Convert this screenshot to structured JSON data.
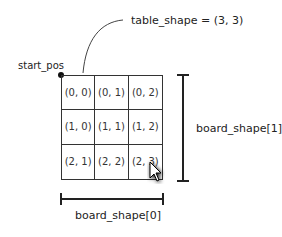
{
  "annotation": {
    "table_shape": "table_shape = (3, 3)",
    "start_pos": "start_pos",
    "board_shape_0": "board_shape[0]",
    "board_shape_1": "board_shape[1]"
  },
  "grid": {
    "rows": 3,
    "cols": 3,
    "cells": [
      [
        "(0, 0)",
        "(0, 1)",
        "(0, 2)"
      ],
      [
        "(1, 0)",
        "(1, 1)",
        "(1, 2)"
      ],
      [
        "(2, 1)",
        "(2, 2)",
        "(2, 3)"
      ]
    ]
  },
  "icons": {
    "cursor": "mouse-pointer-icon"
  }
}
